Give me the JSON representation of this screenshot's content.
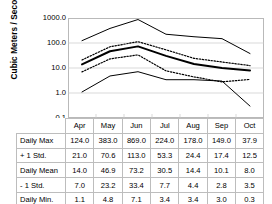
{
  "chart_data": {
    "type": "line",
    "title": "",
    "subtitle": "",
    "xlabel": "",
    "ylabel": "Cubic Meters / Second",
    "log_y": true,
    "ylim": [
      0.1,
      1000.0
    ],
    "y_ticks": [
      "1000.0",
      "100.0",
      "10.0",
      "1.0",
      "0.1"
    ],
    "y_tick_values": [
      1000.0,
      100.0,
      10.0,
      1.0,
      0.1
    ],
    "grid": true,
    "legend": "none",
    "categories": [
      "Apr",
      "May",
      "Jun",
      "Jul",
      "Aug",
      "Sep",
      "Oct"
    ],
    "series": [
      {
        "name": "Daily Max",
        "style": "thin-solid",
        "values": [
          124.0,
          383.0,
          869.0,
          224.0,
          178.0,
          149.0,
          37.9
        ]
      },
      {
        "name": "+ 1 Std.",
        "style": "dotted",
        "values": [
          21.0,
          70.6,
          113.0,
          53.3,
          24.4,
          17.4,
          12.5
        ]
      },
      {
        "name": "Daily Mean",
        "style": "thick-solid",
        "values": [
          14.0,
          46.9,
          73.2,
          30.5,
          14.4,
          10.1,
          8.0
        ]
      },
      {
        "name": "- 1 Std.",
        "style": "dotted",
        "values": [
          7.0,
          23.2,
          33.4,
          7.7,
          4.4,
          2.8,
          3.5
        ]
      },
      {
        "name": "Daily Min.",
        "style": "thin-solid",
        "values": [
          1.1,
          4.8,
          7.1,
          3.4,
          3.4,
          3.0,
          0.3
        ]
      }
    ]
  },
  "table": {
    "columns": [
      "Apr",
      "May",
      "Jun",
      "Jul",
      "Aug",
      "Sep",
      "Oct"
    ],
    "rows": [
      {
        "label": "Daily Max",
        "values": [
          "124.0",
          "383.0",
          "869.0",
          "224.0",
          "178.0",
          "149.0",
          "37.9"
        ]
      },
      {
        "label": "+ 1 Std.",
        "values": [
          "21.0",
          "70.6",
          "113.0",
          "53.3",
          "24.4",
          "17.4",
          "12.5"
        ]
      },
      {
        "label": "Daily Mean",
        "values": [
          "14.0",
          "46.9",
          "73.2",
          "30.5",
          "14.4",
          "10.1",
          "8.0"
        ]
      },
      {
        "label": "- 1 Std.",
        "values": [
          "7.0",
          "23.2",
          "33.4",
          "7.7",
          "4.4",
          "2.8",
          "3.5"
        ]
      },
      {
        "label": "Daily Min.",
        "values": [
          "1.1",
          "4.8",
          "7.1",
          "3.4",
          "3.4",
          "3.0",
          "0.3"
        ]
      }
    ]
  },
  "colors": {
    "line": "#000000",
    "grid": "#c8c8c8",
    "frame": "#b9b9b9",
    "table_border": "#bdbdbd",
    "text": "#000000",
    "background": "#ffffff"
  }
}
